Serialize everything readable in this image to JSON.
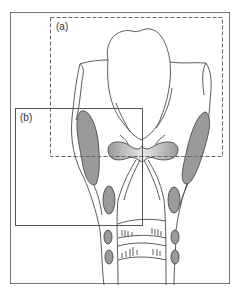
{
  "figure": {
    "type": "anatomical-diagram",
    "regions": [
      {
        "id": "a",
        "label": "(a)",
        "border": "dashed"
      },
      {
        "id": "b",
        "label": "(b)",
        "border": "solid"
      }
    ]
  },
  "colors": {
    "outline": "#4a4a4a",
    "fill_gray": "#9a9a9a",
    "frame": "#666666",
    "background": "#ffffff"
  }
}
